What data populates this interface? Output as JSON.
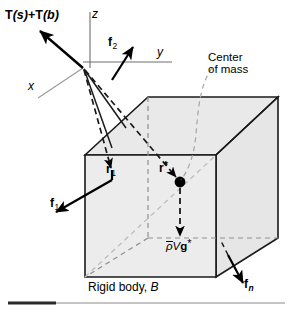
{
  "figure": {
    "caption_prefix": "Rigid body, ",
    "caption_body_symbol": "B",
    "background_color": "#ffffff",
    "body_fill_color": "#e8e8e8",
    "body_stroke_color": "#1a1a1a",
    "dashed_color": "#8c8c8c",
    "axis_color": "#8c8c8c",
    "vector_color": "#000000"
  },
  "axes": {
    "z_label": "z",
    "y_label": "y",
    "x_label": "x"
  },
  "vectors": {
    "traction": {
      "label_T": "T",
      "label_surface_arg": "(s)",
      "label_plus": "+",
      "label_body_arg": "(b)",
      "full_text": "T(s)+T(b)"
    },
    "f2": {
      "symbol": "f",
      "subscript": "2"
    },
    "f1": {
      "symbol": "f",
      "subscript": "1"
    },
    "fn": {
      "symbol": "f",
      "subscript": "n"
    },
    "r1": {
      "symbol": "r",
      "subscript": "1"
    },
    "r_star": {
      "symbol": "r",
      "superscript": "*"
    }
  },
  "annotations": {
    "center_of_mass_line1": "Center",
    "center_of_mass_line2": "of mass",
    "gravity": {
      "density_symbol": "ρ",
      "volume_symbol": "V",
      "gravity_symbol": "g",
      "superscript": "*",
      "full_text": "ρVg*"
    }
  }
}
